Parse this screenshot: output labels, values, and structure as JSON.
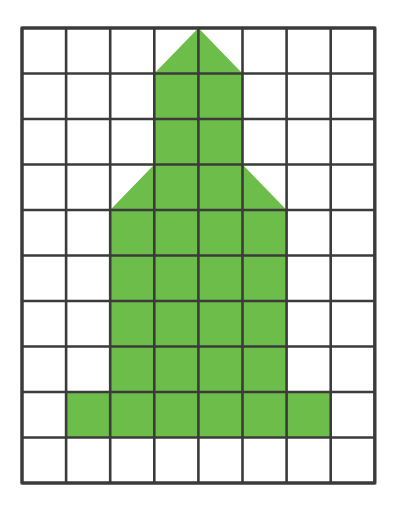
{
  "figure": {
    "background_color": "#ffffff",
    "grid": {
      "columns": 8,
      "rows": 10,
      "origin_x": 22,
      "origin_y": 28,
      "cell_width": 44.1,
      "cell_height": 45.5,
      "line_color": "#3b3b3b",
      "line_width": 2.6,
      "outer_line_width": 3.0,
      "cell_fill": "#ffffff"
    },
    "shape": {
      "name": "arrow-shape",
      "fill_color": "#6cbd4a",
      "stroke": "none",
      "description": "Upward arrow / rocket built from whole and half grid squares",
      "parts": [
        {
          "name": "tip-triangle",
          "type": "triangle",
          "cells": "columns 4-5, row 1",
          "points_cells": [
            [
              4.0,
              0.0
            ],
            [
              3.0,
              1.0
            ],
            [
              5.0,
              1.0
            ]
          ]
        },
        {
          "name": "upper-stem",
          "type": "rectangle",
          "cells": "columns 4-5, rows 2-3",
          "points_cells": [
            [
              3.0,
              1.0
            ],
            [
              5.0,
              1.0
            ],
            [
              5.0,
              3.0
            ],
            [
              3.0,
              3.0
            ]
          ]
        },
        {
          "name": "left-wing-triangle",
          "type": "triangle",
          "cells": "column 3, row 4",
          "points_cells": [
            [
              3.0,
              3.0
            ],
            [
              3.0,
              4.0
            ],
            [
              2.0,
              4.0
            ]
          ]
        },
        {
          "name": "right-wing-triangle",
          "type": "triangle",
          "cells": "column 6, row 4",
          "points_cells": [
            [
              5.0,
              3.0
            ],
            [
              6.0,
              4.0
            ],
            [
              5.0,
              4.0
            ]
          ]
        },
        {
          "name": "mid-body-row4",
          "type": "rectangle",
          "cells": "columns 4-5, row 4",
          "points_cells": [
            [
              3.0,
              3.0
            ],
            [
              5.0,
              3.0
            ],
            [
              5.0,
              4.0
            ],
            [
              3.0,
              4.0
            ]
          ]
        },
        {
          "name": "body",
          "type": "rectangle",
          "cells": "columns 3-6, rows 5-8",
          "points_cells": [
            [
              2.0,
              4.0
            ],
            [
              6.0,
              4.0
            ],
            [
              6.0,
              8.0
            ],
            [
              2.0,
              8.0
            ]
          ]
        },
        {
          "name": "base-band",
          "type": "rectangle",
          "cells": "columns 2-7, row 9",
          "points_cells": [
            [
              1.0,
              8.0
            ],
            [
              7.0,
              8.0
            ],
            [
              7.0,
              9.0
            ],
            [
              1.0,
              9.0
            ]
          ]
        }
      ],
      "outline_cells": [
        [
          4.0,
          0.0
        ],
        [
          5.0,
          1.0
        ],
        [
          5.0,
          3.0
        ],
        [
          6.0,
          4.0
        ],
        [
          6.0,
          8.0
        ],
        [
          7.0,
          8.0
        ],
        [
          7.0,
          9.0
        ],
        [
          1.0,
          9.0
        ],
        [
          1.0,
          8.0
        ],
        [
          2.0,
          8.0
        ],
        [
          2.0,
          4.0
        ],
        [
          3.0,
          3.0
        ],
        [
          3.0,
          1.0
        ]
      ],
      "area_whole_squares": 25,
      "area_half_squares": 4
    }
  }
}
